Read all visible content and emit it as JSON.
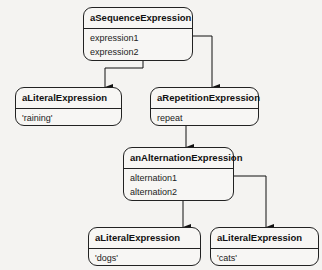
{
  "objects": {
    "sequence": {
      "title": "aSequenceExpression",
      "attrs": [
        "expression1",
        "expression2"
      ]
    },
    "literal_raining": {
      "title": "aLiteralExpression",
      "attrs": [
        "'raining'"
      ]
    },
    "repetition": {
      "title": "aRepetitionExpression",
      "attrs": [
        "repeat"
      ]
    },
    "alternation": {
      "title": "anAlternationExpression",
      "attrs": [
        "alternation1",
        "alternation2"
      ]
    },
    "literal_dogs": {
      "title": "aLiteralExpression",
      "attrs": [
        "'dogs'"
      ]
    },
    "literal_cats": {
      "title": "aLiteralExpression",
      "attrs": [
        "'cats'"
      ]
    }
  },
  "links": [
    {
      "from": "sequence.expression1",
      "to": "repetition"
    },
    {
      "from": "sequence.expression2",
      "to": "literal_raining"
    },
    {
      "from": "repetition.repeat",
      "to": "alternation"
    },
    {
      "from": "alternation.alternation1",
      "to": "literal_cats"
    },
    {
      "from": "alternation.alternation2",
      "to": "literal_dogs"
    }
  ],
  "colors": {
    "line": "#111111",
    "background": "#f4f3f1"
  }
}
